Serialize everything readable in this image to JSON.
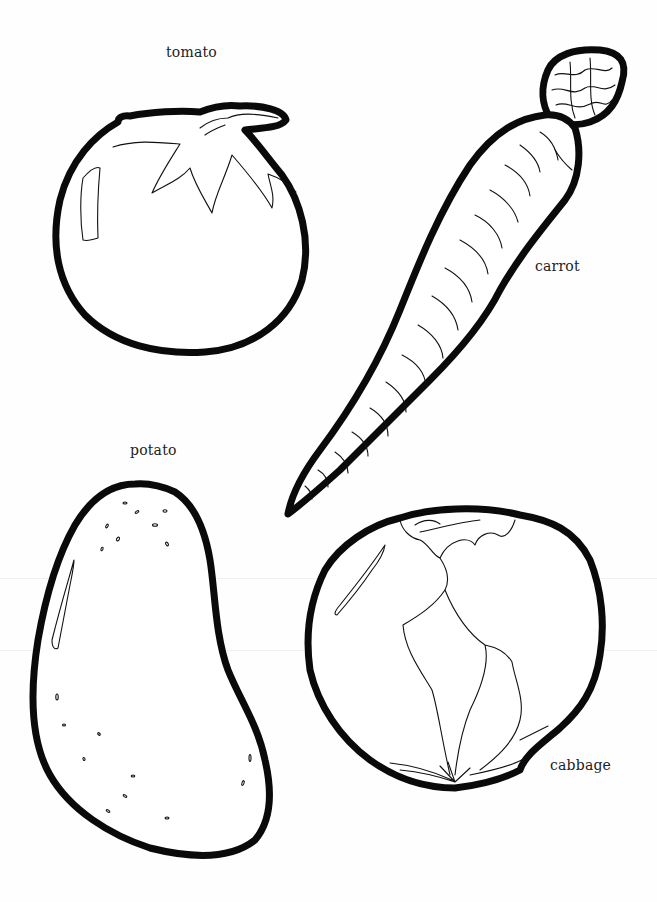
{
  "page": {
    "background_color": "#ffffff",
    "outline_color": "#0a0a0a"
  },
  "vegetables": [
    {
      "id": "tomato",
      "label": "tomato"
    },
    {
      "id": "carrot",
      "label": "carrot"
    },
    {
      "id": "potato",
      "label": "potato"
    },
    {
      "id": "cabbage",
      "label": "cabbage"
    }
  ]
}
